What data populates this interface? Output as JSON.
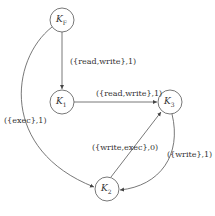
{
  "diagram": {
    "type": "directed-graph",
    "nodes": [
      {
        "id": "KF",
        "label": "K",
        "sub": "F",
        "x": 62,
        "y": 20
      },
      {
        "id": "K1",
        "label": "K",
        "sub": "1",
        "x": 62,
        "y": 102
      },
      {
        "id": "K3",
        "label": "K",
        "sub": "3",
        "x": 170,
        "y": 102
      },
      {
        "id": "K2",
        "label": "K",
        "sub": "2",
        "x": 107,
        "y": 189
      }
    ],
    "edges": [
      {
        "from": "KF",
        "to": "K1",
        "label": "({read,write},1)"
      },
      {
        "from": "K1",
        "to": "K3",
        "label": "({read,write},1)"
      },
      {
        "from": "KF",
        "to": "K2",
        "label": "({exec},1)"
      },
      {
        "from": "K2",
        "to": "K3",
        "label": "({write,exec},0)"
      },
      {
        "from": "K3",
        "to": "K2",
        "label": "({write},1)"
      }
    ]
  }
}
